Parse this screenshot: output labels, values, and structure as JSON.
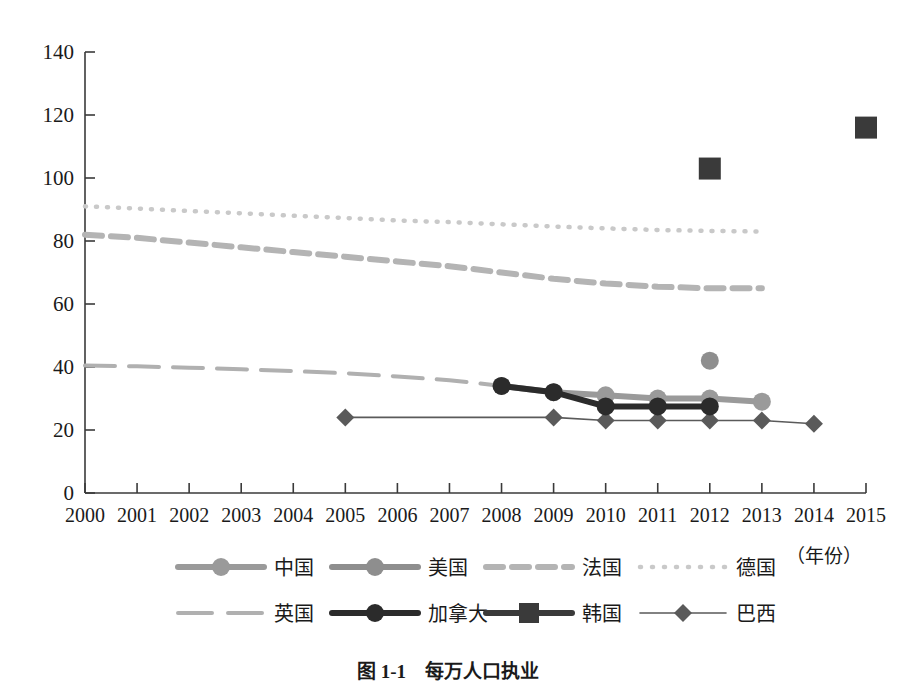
{
  "chart_data": {
    "type": "line",
    "title": "",
    "xlabel": "（年份）",
    "ylabel": "",
    "xlim": [
      2000,
      2015
    ],
    "ylim": [
      0,
      140
    ],
    "ytick_step": 20,
    "grid": false,
    "legend_position": "bottom",
    "categories": [
      "2000",
      "2001",
      "2002",
      "2003",
      "2004",
      "2005",
      "2006",
      "2007",
      "2008",
      "2009",
      "2010",
      "2011",
      "2012",
      "2013",
      "2014",
      "2015"
    ],
    "yticks": [
      "0",
      "20",
      "40",
      "60",
      "80",
      "100",
      "120",
      "140"
    ],
    "series": [
      {
        "name": "中国",
        "marker": "circle",
        "color": "#9a9a9a",
        "linestyle": "solid",
        "x": [
          2008,
          2009,
          2010,
          2011,
          2012,
          2013
        ],
        "values": [
          34,
          32,
          31,
          30,
          30,
          29
        ]
      },
      {
        "name": "美国",
        "marker": "circle",
        "color": "#8e8e8e",
        "linestyle": "solid",
        "x": [
          2012
        ],
        "values": [
          42
        ]
      },
      {
        "name": "法国",
        "marker": "none",
        "color": "#b4b4b4",
        "linestyle": "dashed",
        "x": [
          2000,
          2001,
          2002,
          2003,
          2004,
          2005,
          2006,
          2007,
          2008,
          2009,
          2010,
          2011,
          2012,
          2013
        ],
        "values": [
          82,
          81,
          79.5,
          78,
          76.5,
          75,
          73.5,
          72,
          70,
          68,
          66.5,
          65.5,
          65,
          65
        ]
      },
      {
        "name": "德国",
        "marker": "none",
        "color": "#c9c9c9",
        "linestyle": "dotted",
        "x": [
          2000,
          2001,
          2002,
          2003,
          2004,
          2005,
          2006,
          2007,
          2008,
          2009,
          2010,
          2011,
          2012,
          2013
        ],
        "values": [
          91,
          90.3,
          89.5,
          88.8,
          88,
          87.3,
          86.5,
          86,
          85.3,
          84.6,
          84,
          83.5,
          83.2,
          83
        ]
      },
      {
        "name": "英国",
        "marker": "none",
        "color": "#b0b0b0",
        "linestyle": "longdash",
        "x": [
          2000,
          2001,
          2002,
          2003,
          2004,
          2005,
          2006,
          2007,
          2008
        ],
        "values": [
          40.5,
          40.2,
          39.8,
          39.3,
          38.7,
          38,
          37,
          35.8,
          34
        ]
      },
      {
        "name": "加拿大",
        "marker": "circle",
        "color": "#2b2b2b",
        "linestyle": "solid",
        "x": [
          2008,
          2009,
          2010,
          2011,
          2012
        ],
        "values": [
          34,
          32,
          27.5,
          27.5,
          27.5
        ]
      },
      {
        "name": "韩国",
        "marker": "square",
        "color": "#3a3a3a",
        "linestyle": "solid",
        "x": [
          2012,
          2015
        ],
        "values": [
          103,
          116
        ]
      },
      {
        "name": "巴西",
        "marker": "diamond",
        "color": "#5a5a5a",
        "linestyle": "thin",
        "x": [
          2005,
          2009,
          2010,
          2011,
          2012,
          2013,
          2014
        ],
        "values": [
          24,
          24,
          23,
          23,
          23,
          23,
          22
        ]
      }
    ]
  },
  "legend": {
    "row1": [
      {
        "label": "中国",
        "key": "china"
      },
      {
        "label": "美国",
        "key": "usa"
      },
      {
        "label": "法国",
        "key": "france"
      },
      {
        "label": "德国",
        "key": "germany"
      }
    ],
    "row2": [
      {
        "label": "英国",
        "key": "uk"
      },
      {
        "label": "加拿大",
        "key": "canada"
      },
      {
        "label": "韩国",
        "key": "korea"
      },
      {
        "label": "巴西",
        "key": "brazil"
      }
    ]
  },
  "axes": {
    "x_unit": "（年份）"
  },
  "caption": {
    "text": "图 1-1　每万人口执业"
  },
  "colors": {
    "axis": "#3a3a3a",
    "china": "#9a9a9a",
    "usa": "#8e8e8e",
    "france": "#b4b4b4",
    "germany": "#c9c9c9",
    "uk": "#b0b0b0",
    "canada": "#2b2b2b",
    "korea": "#3a3a3a",
    "brazil": "#5a5a5a"
  }
}
